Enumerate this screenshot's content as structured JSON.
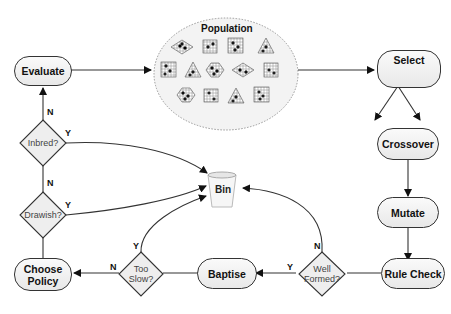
{
  "diagram": {
    "population": {
      "title": "Population"
    },
    "nodes": {
      "evaluate": "Evaluate",
      "select": "Select",
      "crossover": "Crossover",
      "mutate": "Mutate",
      "rule_check": "Rule Check",
      "baptise": "Baptise",
      "choose_policy_line1": "Choose",
      "choose_policy_line2": "Policy",
      "bin": "Bin"
    },
    "decisions": {
      "inbred": "Inbred?",
      "drawish": "Drawish?",
      "too_slow_line1": "Too",
      "too_slow_line2": "Slow?",
      "well_formed_line1": "Well",
      "well_formed_line2": "Formed?"
    },
    "edge_labels": {
      "yes": "Y",
      "no": "N"
    },
    "colors": {
      "line": "#333333",
      "node_fill_top": "#fafafa",
      "node_fill_bottom": "#e8e8e8",
      "population_fill": "#f3f3f3"
    }
  }
}
